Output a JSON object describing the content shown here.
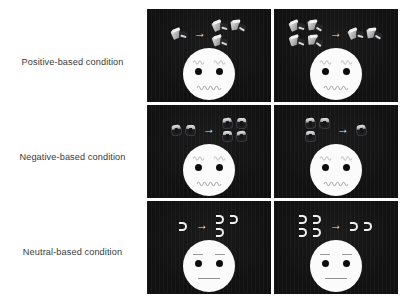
{
  "figure": {
    "background_color": "#ffffff",
    "panel_color": "#111112",
    "face_color": "#fbfbfb",
    "label_color": "#3a3a3a",
    "columns": 2,
    "rows": 3
  },
  "rows": [
    {
      "label": "Positive-based condition",
      "object_type": "positive-reward-object",
      "face": {
        "expression": "happy",
        "eyes": "round-black-dots",
        "eyebrows": "wavy-arched",
        "mouth": "wavy-smile"
      },
      "panels": [
        {
          "position": "left",
          "before_count": 1,
          "after_count": 3,
          "arrow_glyph": "→",
          "change": "increase"
        },
        {
          "position": "right",
          "before_count": 4,
          "after_count": 2,
          "arrow_glyph": "→",
          "change": "decrease"
        }
      ]
    },
    {
      "label": "Negative-based condition",
      "object_type": "negative-loss-object",
      "face": {
        "expression": "happy",
        "eyes": "round-black-dots",
        "eyebrows": "wavy-arched",
        "mouth": "wavy-smile"
      },
      "panels": [
        {
          "position": "left",
          "before_count": 2,
          "after_count": 4,
          "arrow_glyph": "→",
          "change": "increase"
        },
        {
          "position": "right",
          "before_count": 3,
          "after_count": 1,
          "arrow_glyph": "→",
          "change": "decrease"
        }
      ]
    },
    {
      "label": "Neutral-based condition",
      "object_type": "neutral-u-shape",
      "face": {
        "expression": "neutral",
        "eyes": "round-black-dots",
        "eyebrows": "straight-flat",
        "mouth": "straight-line"
      },
      "panels": [
        {
          "position": "left",
          "before_count": 1,
          "after_count": 3,
          "arrow_glyph": "→",
          "change": "increase"
        },
        {
          "position": "right",
          "before_count": 4,
          "after_count": 2,
          "arrow_glyph": "→",
          "change": "decrease"
        }
      ]
    }
  ]
}
